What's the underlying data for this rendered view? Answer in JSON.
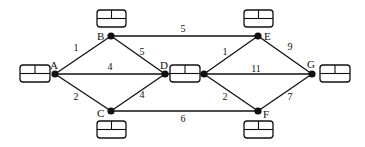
{
  "diagram": {
    "type": "network-graph",
    "nodes": [
      {
        "id": "A",
        "label": "A",
        "x": 55,
        "y": 74,
        "lx": 50,
        "ly": 69
      },
      {
        "id": "B",
        "label": "B",
        "x": 111,
        "y": 36,
        "lx": 97,
        "ly": 40
      },
      {
        "id": "C",
        "label": "C",
        "x": 111,
        "y": 111,
        "lx": 97,
        "ly": 117
      },
      {
        "id": "D",
        "label": "D",
        "x": 165,
        "y": 74,
        "lx": 160,
        "ly": 69
      },
      {
        "id": "D2",
        "label": "",
        "x": 204,
        "y": 74,
        "lx": 0,
        "ly": 0
      },
      {
        "id": "E",
        "label": "E",
        "x": 258,
        "y": 36,
        "lx": 264,
        "ly": 40
      },
      {
        "id": "F",
        "label": "F",
        "x": 258,
        "y": 111,
        "lx": 263,
        "ly": 118
      },
      {
        "id": "G",
        "label": "G",
        "x": 312,
        "y": 74,
        "lx": 307,
        "ly": 68
      }
    ],
    "edges": [
      {
        "from": "A",
        "to": "B",
        "weight": "1",
        "lx": 76,
        "ly": 51
      },
      {
        "from": "A",
        "to": "D",
        "weight": "4",
        "lx": 110,
        "ly": 70
      },
      {
        "from": "A",
        "to": "C",
        "weight": "2",
        "lx": 76,
        "ly": 100
      },
      {
        "from": "B",
        "to": "D",
        "weight": "5",
        "lx": 142,
        "ly": 55
      },
      {
        "from": "C",
        "to": "D",
        "weight": "4",
        "lx": 142,
        "ly": 98
      },
      {
        "from": "B",
        "to": "E",
        "weight": "5",
        "lx": 183,
        "ly": 32
      },
      {
        "from": "C",
        "to": "F",
        "weight": "6",
        "lx": 183,
        "ly": 122
      },
      {
        "from": "D2",
        "to": "E",
        "weight": "1",
        "lx": 225,
        "ly": 55
      },
      {
        "from": "D2",
        "to": "G",
        "weight": "11",
        "lx": 256,
        "ly": 72
      },
      {
        "from": "D2",
        "to": "F",
        "weight": "2",
        "lx": 225,
        "ly": 100
      },
      {
        "from": "E",
        "to": "G",
        "weight": "9",
        "lx": 290,
        "ly": 50
      },
      {
        "from": "F",
        "to": "G",
        "weight": "7",
        "lx": 290,
        "ly": 100
      }
    ],
    "boxes": [
      {
        "node": "A",
        "x": 20,
        "y": 65,
        "w": 30,
        "h": 17
      },
      {
        "node": "B",
        "x": 97,
        "y": 10,
        "w": 29,
        "h": 17
      },
      {
        "node": "C",
        "x": 97,
        "y": 121,
        "w": 29,
        "h": 17
      },
      {
        "node": "D",
        "x": 170,
        "y": 65,
        "w": 30,
        "h": 17
      },
      {
        "node": "E",
        "x": 244,
        "y": 10,
        "w": 29,
        "h": 17
      },
      {
        "node": "F",
        "x": 244,
        "y": 121,
        "w": 29,
        "h": 17
      },
      {
        "node": "G",
        "x": 320,
        "y": 65,
        "w": 30,
        "h": 17
      }
    ]
  }
}
